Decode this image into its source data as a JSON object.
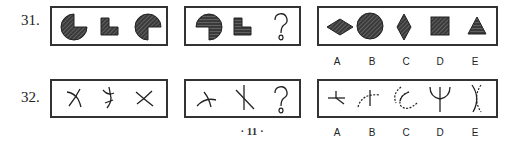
{
  "questions": [
    {
      "number": "31.",
      "stem_figures": [
        "circle-quarter-missing-right",
        "l-shape-block",
        "circle-quarter-missing-bottom-right"
      ],
      "partial_figures": [
        "circle-quarter-missing-bottom-left",
        "l-shape-block",
        "question-mark"
      ],
      "question_mark": "?",
      "options": [
        {
          "label": "A",
          "figure": "diamond-wide"
        },
        {
          "label": "B",
          "figure": "circle"
        },
        {
          "label": "C",
          "figure": "diamond-tall"
        },
        {
          "label": "D",
          "figure": "square"
        },
        {
          "label": "E",
          "figure": "triangle"
        }
      ]
    },
    {
      "number": "32.",
      "stem_figures": [
        "crossed-curve-lines-1",
        "crossed-curve-lines-2",
        "x-cross"
      ],
      "partial_figures": [
        "arc-with-cross",
        "slanted-cross",
        "question-mark"
      ],
      "question_mark": "?",
      "options": [
        {
          "label": "A",
          "figure": "short-cross"
        },
        {
          "label": "B",
          "figure": "dashed-arc-with-stem"
        },
        {
          "label": "C",
          "figure": "dashed-arc-curve"
        },
        {
          "label": "D",
          "figure": "trident-curve"
        },
        {
          "label": "E",
          "figure": "dashed-x-curves"
        }
      ]
    }
  ],
  "page_number": "· 11 ·",
  "colors": {
    "ink": "#222222",
    "hatch": "#555555"
  }
}
